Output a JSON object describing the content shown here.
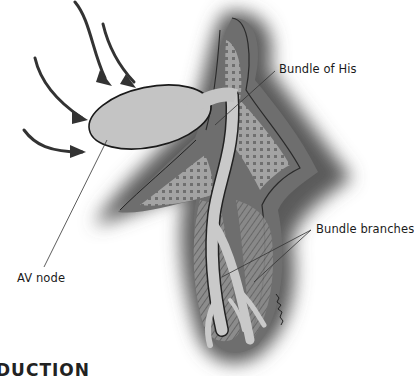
{
  "figure": {
    "labels": {
      "bundle_of_his": "Bundle of His",
      "bundle_branches": "Bundle branches",
      "av_node": "AV node"
    },
    "icons": {
      "arrows": "impulse-arrow-icon"
    },
    "signature": "artist signature"
  },
  "footer": {
    "heading_fragment": "DUCTION"
  }
}
